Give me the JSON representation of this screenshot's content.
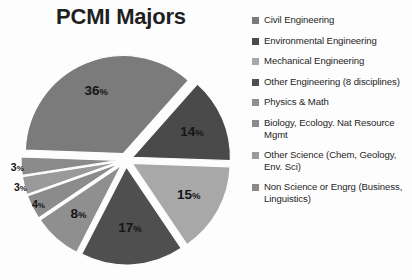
{
  "chart_title": "PCMI Majors",
  "chart_data": {
    "type": "pie",
    "title": "PCMI Majors",
    "exploded": true,
    "legend_position": "right",
    "grid": false,
    "categories": [
      "Civil Engineering",
      "Environmental Engineering",
      "Mechanical Engineering",
      "Other Engineering (8 disciplines)",
      "Physics & Math",
      "Biology, Ecology. Nat Resource Mgmt",
      "Other Science (Chem, Geology, Env. Sci)",
      "Non Science or Engrg (Business, Linguistics)"
    ],
    "values": [
      36,
      14,
      15,
      17,
      8,
      4,
      3,
      3
    ],
    "value_labels": [
      "36%",
      "14%",
      "15%",
      "17%",
      "8%",
      "4%",
      "3%",
      "3%"
    ],
    "colors": [
      "#7b7b7b",
      "#4a4a4a",
      "#a8a8a8",
      "#4f4f4f",
      "#8f8f8f",
      "#8b8b8b",
      "#9a9a9a",
      "#8a8a8a"
    ]
  },
  "slices": [
    {
      "label": "36%",
      "num": "36",
      "sign": "%",
      "value": 36,
      "color": "#7b7b7b"
    },
    {
      "label": "14%",
      "num": "14",
      "sign": "%",
      "value": 14,
      "color": "#4a4a4a"
    },
    {
      "label": "15%",
      "num": "15",
      "sign": "%",
      "value": 15,
      "color": "#a8a8a8"
    },
    {
      "label": "17%",
      "num": "17",
      "sign": "%",
      "value": 17,
      "color": "#4f4f4f"
    },
    {
      "label": "8%",
      "num": "8",
      "sign": "%",
      "value": 8,
      "color": "#8f8f8f"
    },
    {
      "label": "4%",
      "num": "4",
      "sign": "%",
      "value": 4,
      "color": "#8b8b8b"
    },
    {
      "label": "3%",
      "num": "3",
      "sign": "%",
      "value": 3,
      "color": "#9a9a9a"
    },
    {
      "label": "3%",
      "num": "3",
      "sign": "%",
      "value": 3,
      "color": "#8a8a8a"
    }
  ],
  "legend": {
    "items": [
      {
        "label": "Civil Engineering",
        "color": "#7b7b7b"
      },
      {
        "label": "Environmental Engineering",
        "color": "#4a4a4a"
      },
      {
        "label": "Mechanical Engineering",
        "color": "#a8a8a8"
      },
      {
        "label": "Other Engineering (8 disciplines)",
        "color": "#4f4f4f"
      },
      {
        "label": "Physics & Math",
        "color": "#8f8f8f"
      },
      {
        "label": "Biology, Ecology. Nat Resource Mgmt",
        "color": "#8b8b8b"
      },
      {
        "label": "Other Science (Chem, Geology, Env. Sci)",
        "color": "#9a9a9a"
      },
      {
        "label": "Non Science or Engrg (Business, Linguistics)",
        "color": "#8a8a8a"
      }
    ]
  }
}
